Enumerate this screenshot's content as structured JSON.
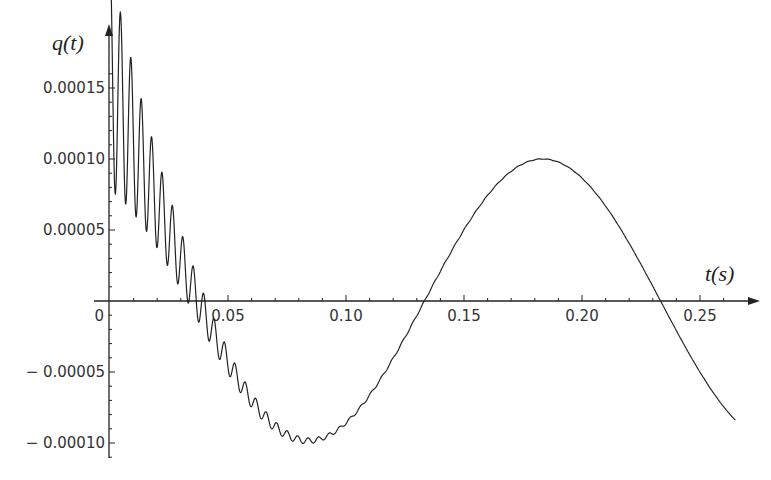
{
  "chart_data": {
    "type": "line",
    "title": "",
    "xlabel": "t(s)",
    "ylabel": "q(t)",
    "xlim": [
      0,
      0.265
    ],
    "ylim": [
      -0.00011,
      0.00017
    ],
    "grid": false,
    "legend": null,
    "x_ticks": [
      "0",
      "0.05",
      "0.10",
      "0.15",
      "0.20",
      "0.25"
    ],
    "y_ticks": [
      "0.00015",
      "0.00010",
      "0.00005",
      "-0.00005",
      "-0.00010"
    ],
    "series": [
      {
        "name": "q(t)",
        "description": "Slow sinusoid of amplitude ~0.0001 and period ~0.2 s (q ≈ -0.0001·sin(2π·t/0.2)) with superimposed high-frequency decaying oscillation (amplitude ~0.00008 at t=0 decaying to ~0 by t≈0.1 s)",
        "x": [
          0,
          0.01,
          0.02,
          0.03,
          0.04,
          0.05,
          0.06,
          0.07,
          0.083,
          0.1,
          0.12,
          0.133,
          0.15,
          0.17,
          0.183,
          0.2,
          0.22,
          0.233,
          0.25,
          0.265
        ],
        "values": [
          8e-05,
          6e-05,
          4e-05,
          1e-05,
          -1e-05,
          -4e-05,
          -6e-05,
          -8e-05,
          -0.0001,
          -9.5e-05,
          -4e-05,
          0,
          4.8e-05,
          9e-05,
          0.0001,
          9.2e-05,
          4e-05,
          0,
          -3e-05,
          -5e-05
        ],
        "envelope_upper": [
          0.00016,
          0.000125,
          8.5e-05,
          4e-05,
          5e-06
        ],
        "envelope_lower": [
          0,
          1e-05,
          0,
          -2e-05,
          -4e-05
        ],
        "envelope_x": [
          0,
          0.01,
          0.02,
          0.03,
          0.04
        ]
      }
    ]
  },
  "axes": {
    "x_title": "t(s)",
    "y_title": "q(t)"
  }
}
